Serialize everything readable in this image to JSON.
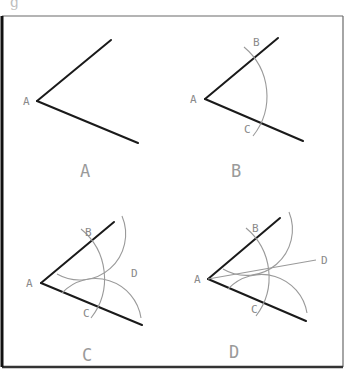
{
  "figure": {
    "top_fragment": "g",
    "colors": {
      "ray": "#1a1a1a",
      "arc": "#9a9a9a",
      "label": "#8a8a8a",
      "frame": "#6a6a6a"
    }
  },
  "panels": [
    {
      "caption": "A",
      "step": "Given angle with vertex A",
      "labels": {
        "vertex": "A"
      }
    },
    {
      "caption": "B",
      "step": "Arc centered at A cuts arms at B and C",
      "labels": {
        "vertex": "A",
        "b": "B",
        "c": "C"
      }
    },
    {
      "caption": "C",
      "step": "Arcs centered at B and C intersect at D",
      "labels": {
        "vertex": "A",
        "b": "B",
        "c": "C",
        "d": "D"
      }
    },
    {
      "caption": "D",
      "step": "Line AD bisects the angle",
      "labels": {
        "vertex": "A",
        "b": "B",
        "c": "C",
        "d": "D"
      }
    }
  ]
}
